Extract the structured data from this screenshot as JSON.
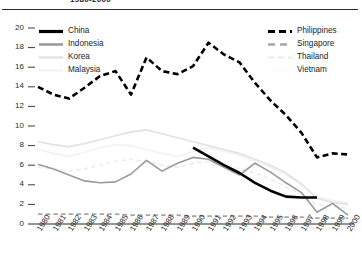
{
  "chart_title": "1980-2000",
  "axes": {
    "y_ticks": [
      "20",
      "18",
      "16",
      "14",
      "12",
      "10",
      "8",
      "6",
      "4",
      "2",
      "0"
    ],
    "x_ticks": [
      "1980",
      "1981",
      "1982",
      "1983",
      "1984",
      "1985",
      "1986",
      "1987",
      "1988",
      "1989",
      "1990",
      "1991",
      "1992",
      "1993",
      "1994",
      "1995",
      "1996",
      "1997",
      "1998",
      "1999",
      "2000"
    ]
  },
  "legend": {
    "left": [
      {
        "label": "China",
        "color": "#000000",
        "style": "solid-thick"
      },
      {
        "label": "Indonesia",
        "color": "#9a9a9a",
        "style": "solid"
      },
      {
        "label": "Korea",
        "color": "#e2e2e2",
        "style": "solid"
      },
      {
        "label": "Malaysia",
        "color": "#f2f2f2",
        "style": "solid"
      }
    ],
    "right": [
      {
        "label": "Philippines",
        "color": "#000000",
        "style": "dashed-thick"
      },
      {
        "label": "Singapore",
        "color": "#a6a6a6",
        "style": "dashed"
      },
      {
        "label": "Thailand",
        "color": "#ededed",
        "style": "dashed"
      },
      {
        "label": "Vietnam",
        "color": "#fafafa",
        "style": "solid"
      }
    ]
  },
  "chart_data": {
    "type": "line",
    "title": "1980-2000",
    "xlabel": "",
    "ylabel": "",
    "ylim": [
      0,
      20
    ],
    "ytick_step": 2,
    "grid": false,
    "legend_position": "top-inside-split",
    "x": [
      1980,
      1981,
      1982,
      1983,
      1984,
      1985,
      1986,
      1987,
      1988,
      1989,
      1990,
      1991,
      1992,
      1993,
      1994,
      1995,
      1996,
      1997,
      1998,
      1999,
      2000
    ],
    "series": [
      {
        "name": "Philippines",
        "color": "#000000",
        "style": "dashed-thick",
        "values": [
          14.0,
          13.2,
          12.8,
          13.9,
          15.1,
          15.6,
          13.2,
          17.0,
          15.6,
          15.3,
          16.1,
          18.5,
          17.3,
          16.5,
          14.4,
          12.6,
          11.1,
          9.3,
          6.8,
          7.2,
          7.1
        ]
      },
      {
        "name": "Indonesia",
        "color": "#9a9a9a",
        "style": "solid",
        "values": [
          6.1,
          5.6,
          5.0,
          4.4,
          4.2,
          4.3,
          5.1,
          6.5,
          5.4,
          6.2,
          6.8,
          6.6,
          5.8,
          5.0,
          6.2,
          5.3,
          4.2,
          3.2,
          1.2,
          2.1,
          0.9
        ]
      },
      {
        "name": "Korea",
        "color": "#e2e2e2",
        "style": "solid",
        "values": [
          8.4,
          8.1,
          7.9,
          8.2,
          8.6,
          9.0,
          9.4,
          9.6,
          9.2,
          8.8,
          8.4,
          8.0,
          7.6,
          7.2,
          6.6,
          6.0,
          5.2,
          4.1,
          2.6,
          2.2,
          2.0
        ]
      },
      {
        "name": "Malaysia",
        "color": "#f2f2f2",
        "style": "solid",
        "values": [
          7.6,
          7.2,
          6.9,
          7.3,
          7.8,
          8.1,
          8.0,
          7.6,
          7.2,
          6.9,
          7.4,
          7.8,
          7.4,
          7.0,
          6.4,
          5.8,
          5.0,
          4.0,
          2.8,
          2.4,
          2.2
        ]
      },
      {
        "name": "Singapore",
        "color": "#a6a6a6",
        "style": "dashed",
        "values": [
          1.0,
          1.0,
          1.0,
          1.0,
          1.0,
          1.0,
          0.9,
          0.9,
          0.9,
          0.9,
          0.8,
          0.8,
          0.8,
          0.8,
          0.8,
          0.7,
          0.7,
          0.7,
          0.6,
          0.6,
          0.6
        ]
      },
      {
        "name": "Thailand",
        "color": "#ededed",
        "style": "dashed",
        "values": [
          5.8,
          5.6,
          5.4,
          5.6,
          6.0,
          6.4,
          6.6,
          6.4,
          6.0,
          5.8,
          6.2,
          6.4,
          6.0,
          5.6,
          5.2,
          4.6,
          3.8,
          3.0,
          2.0,
          1.8,
          1.6
        ]
      },
      {
        "name": "China",
        "color": "#000000",
        "style": "solid-thick",
        "values": [
          null,
          null,
          null,
          null,
          null,
          null,
          null,
          null,
          null,
          null,
          7.8,
          6.9,
          6.0,
          5.2,
          4.2,
          3.4,
          2.8,
          2.7,
          2.7,
          null,
          null
        ]
      },
      {
        "name": "Vietnam",
        "color": "#fafafa",
        "style": "solid",
        "values": [
          null,
          null,
          null,
          null,
          null,
          null,
          null,
          null,
          null,
          null,
          null,
          null,
          null,
          null,
          null,
          null,
          null,
          null,
          null,
          null,
          null
        ]
      }
    ]
  }
}
